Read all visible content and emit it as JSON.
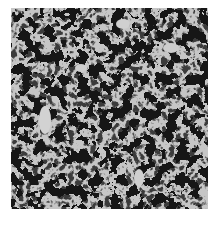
{
  "image": {
    "description": "Grayscale optical micrograph showing light-gray grains/particles separated by dark network boundaries",
    "colors": {
      "background": "#ffffff",
      "grain": "#c9c9c9",
      "boundary": "#1a1a1a",
      "mid": "#6e6e6e"
    }
  }
}
